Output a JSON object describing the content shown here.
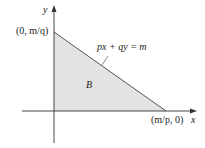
{
  "diagram": {
    "axes": {
      "x_label": "x",
      "y_label": "y"
    },
    "region_label": "B",
    "line_equation": "px + qy = m",
    "y_intercept_label": "(0, m/q)",
    "x_intercept_label": "(m/p, 0)",
    "colors": {
      "region_fill": "#e3e3e3",
      "line": "#555555",
      "axis": "#333333"
    }
  }
}
